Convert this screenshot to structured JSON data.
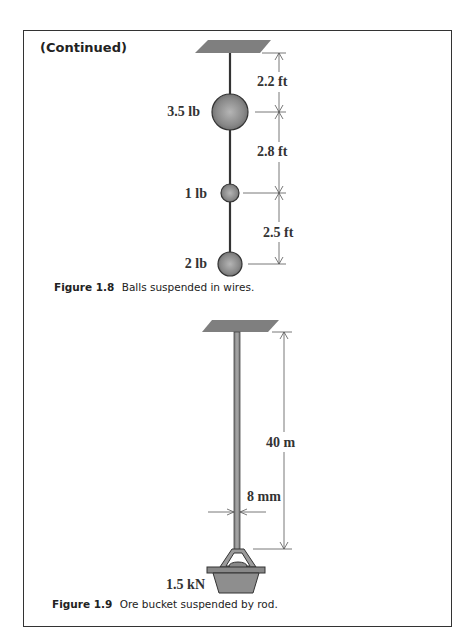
{
  "header": {
    "continued_label": "(Continued)"
  },
  "figure_1_8": {
    "caption_number": "Figure 1.8",
    "caption_text": "Balls suspended in wires.",
    "balls": [
      {
        "weight": "3.5 lb"
      },
      {
        "weight": "1 lb"
      },
      {
        "weight": "2 lb"
      }
    ],
    "dimensions": [
      {
        "label": "2.2 ft"
      },
      {
        "label": "2.8 ft"
      },
      {
        "label": "2.5 ft"
      }
    ]
  },
  "figure_1_9": {
    "caption_number": "Figure 1.9",
    "caption_text": "Ore bucket suspended by rod.",
    "length_label": "40 m",
    "diameter_label": "8 mm",
    "load_label": "1.5 kN"
  },
  "colors": {
    "ball": "#8a8a8a",
    "ceiling": "#7a7a7a",
    "line": "#333333",
    "border": "#333333"
  }
}
